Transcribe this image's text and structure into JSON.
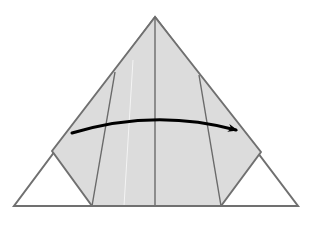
{
  "diagram": {
    "type": "origami-fold-step",
    "colors": {
      "background": "#ffffff",
      "paper_shaded": "#dcdcdc",
      "paper_white": "#ffffff",
      "edge": "#707070",
      "crease": "#6a6a6a",
      "arrow": "#000000"
    },
    "shapes": {
      "outer_triangle": "155,17 14,206 298,206",
      "shaded_region": "155,17 261,152 221,206 92,206 52,151",
      "center_crease": [
        155,
        17,
        155,
        206
      ],
      "left_crease": [
        115,
        72,
        92,
        206
      ],
      "right_crease": [
        199,
        75,
        221,
        206
      ],
      "fold_arrow_path": "M72,133 Q155,108 236,130"
    },
    "annotation": "fold-arrow-left-to-right"
  }
}
